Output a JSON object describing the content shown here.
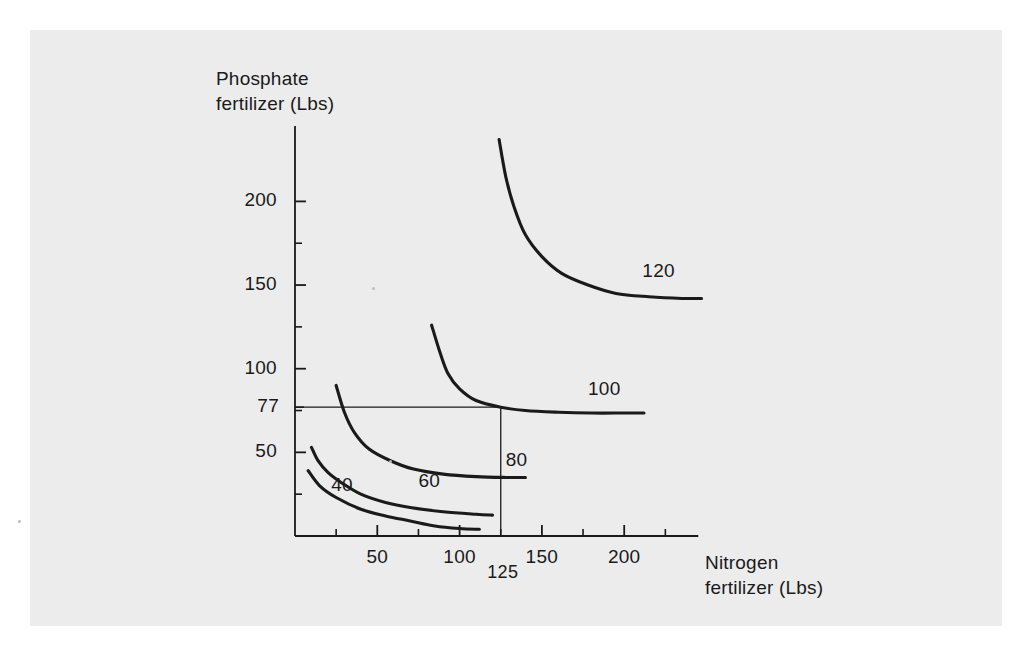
{
  "page": {
    "background_color": "#ffffff",
    "paper_color": "#ececed",
    "ink_color": "#1a1a1a"
  },
  "chart_data": {
    "type": "line",
    "title": "",
    "subtitle": "",
    "xlabel": "Nitrogen\nfertilizer (Lbs)",
    "ylabel": "Phosphate\nfertilizer (Lbs)",
    "xlim": [
      0,
      245
    ],
    "ylim": [
      0,
      245
    ],
    "grid": false,
    "legend_position": "inline-right-of-curve",
    "x_ticks_major": [
      50,
      100,
      150,
      200
    ],
    "x_ticks_minor": [
      25,
      75,
      125,
      175,
      225
    ],
    "x_tick_labels": [
      "50",
      "100",
      "150",
      "200"
    ],
    "y_ticks_major": [
      50,
      100,
      150,
      200
    ],
    "y_ticks_minor": [
      25,
      75,
      125,
      175
    ],
    "y_tick_labels": [
      "50",
      "100",
      "150",
      "200"
    ],
    "special_y_tick": {
      "value": 77,
      "label": "77"
    },
    "special_x_tick": {
      "value": 125,
      "label": "125"
    },
    "reference_lines": [
      {
        "name": "phosphate-77-line",
        "orientation": "horizontal",
        "value": 77,
        "from": 0,
        "to": 125
      },
      {
        "name": "nitrogen-125-line",
        "orientation": "vertical",
        "value": 125,
        "from": 0,
        "to": 77
      }
    ],
    "annotations": [
      {
        "name": "optimum-point",
        "x": 125,
        "y": 77,
        "text": ""
      }
    ],
    "series": [
      {
        "name": "40",
        "label": "40",
        "label_x": 22,
        "label_y": 30,
        "points": [
          [
            8,
            39
          ],
          [
            15,
            30
          ],
          [
            25,
            23
          ],
          [
            40,
            16
          ],
          [
            55,
            12
          ],
          [
            70,
            9
          ],
          [
            85,
            6
          ],
          [
            100,
            4.5
          ],
          [
            112,
            4
          ]
        ]
      },
      {
        "name": "60",
        "label": "60",
        "label_x": 75,
        "label_y": 32,
        "points": [
          [
            10,
            53
          ],
          [
            14,
            45
          ],
          [
            20,
            38
          ],
          [
            28,
            32
          ],
          [
            40,
            25
          ],
          [
            55,
            20
          ],
          [
            70,
            17
          ],
          [
            90,
            14.5
          ],
          [
            110,
            13
          ],
          [
            120,
            12.5
          ]
        ]
      },
      {
        "name": "80",
        "label": "80",
        "label_x": 128,
        "label_y": 45,
        "points": [
          [
            25,
            90
          ],
          [
            30,
            74
          ],
          [
            36,
            62
          ],
          [
            45,
            52
          ],
          [
            58,
            45
          ],
          [
            72,
            40
          ],
          [
            90,
            37
          ],
          [
            110,
            35.5
          ],
          [
            128,
            35
          ],
          [
            140,
            35
          ]
        ]
      },
      {
        "name": "100",
        "label": "100",
        "label_x": 178,
        "label_y": 87,
        "points": [
          [
            83,
            126
          ],
          [
            88,
            110
          ],
          [
            93,
            97
          ],
          [
            100,
            88
          ],
          [
            110,
            81
          ],
          [
            125,
            77
          ],
          [
            140,
            75
          ],
          [
            160,
            74
          ],
          [
            180,
            73.5
          ],
          [
            200,
            73.5
          ],
          [
            212,
            73.5
          ]
        ]
      },
      {
        "name": "120",
        "label": "120",
        "label_x": 211,
        "label_y": 158,
        "points": [
          [
            124,
            237
          ],
          [
            128,
            215
          ],
          [
            133,
            197
          ],
          [
            140,
            180
          ],
          [
            150,
            167
          ],
          [
            162,
            157
          ],
          [
            178,
            150
          ],
          [
            195,
            145
          ],
          [
            215,
            143
          ],
          [
            235,
            142
          ],
          [
            247,
            142
          ]
        ]
      }
    ]
  }
}
